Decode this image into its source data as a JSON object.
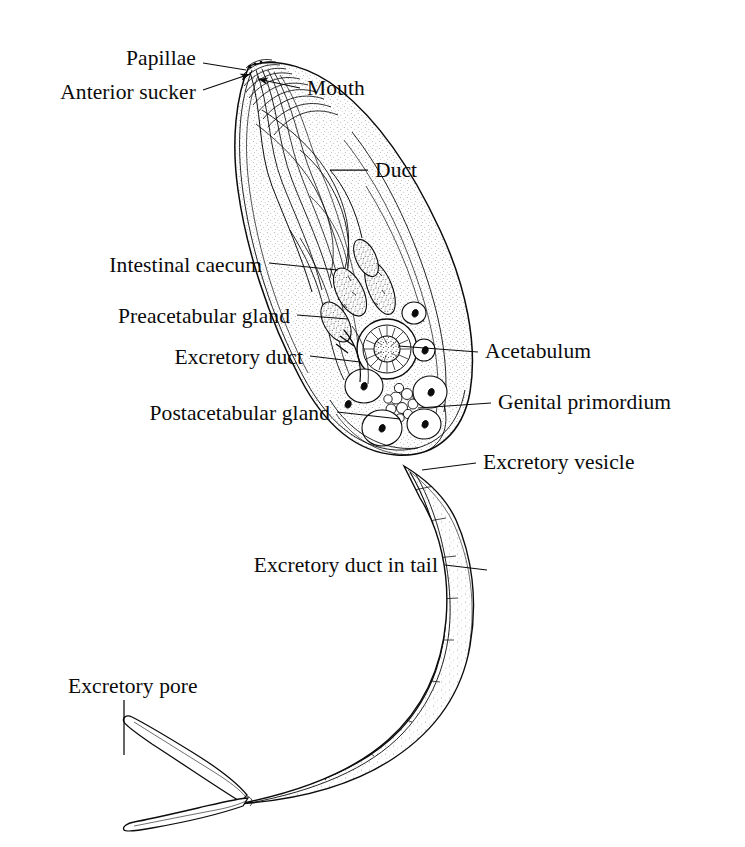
{
  "figure": {
    "ink_color": "#0b0b0b",
    "background_color": "#ffffff"
  },
  "labels": [
    {
      "id": "papillae",
      "text": "Papillae",
      "x": 196,
      "y": 59,
      "align": "right"
    },
    {
      "id": "anterior-sucker",
      "text": "Anterior sucker",
      "x": 196,
      "y": 93,
      "align": "right"
    },
    {
      "id": "mouth",
      "text": "Mouth",
      "x": 307,
      "y": 89,
      "align": "left"
    },
    {
      "id": "duct",
      "text": "Duct",
      "x": 375,
      "y": 171,
      "align": "left"
    },
    {
      "id": "intestinal-caecum",
      "text": "Intestinal caecum",
      "x": 262,
      "y": 266,
      "align": "right"
    },
    {
      "id": "preacetabular-gland",
      "text": "Preacetabular gland",
      "x": 290,
      "y": 317,
      "align": "right"
    },
    {
      "id": "excretory-duct",
      "text": "Excretory duct",
      "x": 303,
      "y": 358,
      "align": "right"
    },
    {
      "id": "acetabulum",
      "text": "Acetabulum",
      "x": 485,
      "y": 352,
      "align": "left"
    },
    {
      "id": "genital-primordium",
      "text": "Genital primordium",
      "x": 498,
      "y": 403,
      "align": "left"
    },
    {
      "id": "postacetabular-gland",
      "text": "Postacetabular gland",
      "x": 330,
      "y": 414,
      "align": "right"
    },
    {
      "id": "excretory-vesicle",
      "text": "Excretory vesicle",
      "x": 483,
      "y": 463,
      "align": "left"
    },
    {
      "id": "excretory-duct-tail",
      "text": "Excretory duct in tail",
      "x": 438,
      "y": 566,
      "align": "right"
    },
    {
      "id": "excretory-pore",
      "text": "Excretory pore",
      "x": 68,
      "y": 687,
      "align": "left"
    }
  ],
  "leader_lines": [
    {
      "id": "leader-papillae",
      "from": [
        203,
        63
      ],
      "to": [
        246,
        70
      ],
      "arrow": false
    },
    {
      "id": "leader-anterior-sucker",
      "from": [
        203,
        90
      ],
      "to": [
        250,
        74
      ],
      "arrow": true
    },
    {
      "id": "leader-mouth",
      "from": [
        300,
        88
      ],
      "to": [
        258,
        79
      ],
      "arrow": true
    },
    {
      "id": "leader-duct",
      "from": [
        368,
        170
      ],
      "to": [
        330,
        170
      ],
      "arrow": false
    },
    {
      "id": "leader-intestinal-caecum",
      "from": [
        269,
        263
      ],
      "to": [
        337,
        270
      ],
      "arrow": false
    },
    {
      "id": "leader-preacetabular-gland",
      "from": [
        297,
        315
      ],
      "to": [
        348,
        319
      ],
      "arrow": false
    },
    {
      "id": "leader-excretory-duct",
      "from": [
        310,
        356
      ],
      "to": [
        360,
        362
      ],
      "arrow": false
    },
    {
      "id": "leader-acetabulum",
      "from": [
        478,
        352
      ],
      "to": [
        398,
        346
      ],
      "arrow": false
    },
    {
      "id": "leader-genital-primordium",
      "from": [
        491,
        403
      ],
      "to": [
        418,
        408
      ],
      "arrow": false
    },
    {
      "id": "leader-postacetabular-gland",
      "from": [
        337,
        412
      ],
      "to": [
        400,
        419
      ],
      "arrow": false
    },
    {
      "id": "leader-excretory-vesicle",
      "from": [
        476,
        463
      ],
      "to": [
        422,
        470
      ],
      "arrow": false
    },
    {
      "id": "leader-excretory-duct-tail",
      "from": [
        445,
        565
      ],
      "to": [
        487,
        570
      ],
      "arrow": false
    },
    {
      "id": "leader-excretory-pore",
      "from": [
        124,
        700
      ],
      "to": [
        124,
        755
      ],
      "arrow": false
    }
  ]
}
